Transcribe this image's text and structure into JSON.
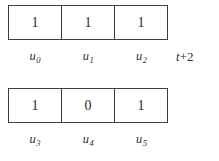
{
  "diagram": {
    "type": "register-cell-diagram",
    "background_color": "#ffffff",
    "border_color": "#3c3c3c",
    "text_color": "#2f2f2f",
    "rows": [
      {
        "id": "row-top",
        "cells": [
          {
            "value": "1",
            "label_base": "u",
            "label_sub": "0"
          },
          {
            "value": "1",
            "label_base": "u",
            "label_sub": "1"
          },
          {
            "value": "1",
            "label_base": "u",
            "label_sub": "2"
          }
        ],
        "annotation": {
          "var": "t",
          "rest": "+2",
          "full": "t+2"
        }
      },
      {
        "id": "row-bottom",
        "cells": [
          {
            "value": "1",
            "label_base": "u",
            "label_sub": "3"
          },
          {
            "value": "0",
            "label_base": "u",
            "label_sub": "4"
          },
          {
            "value": "1",
            "label_base": "u",
            "label_sub": "5"
          }
        ],
        "annotation": null
      }
    ]
  }
}
